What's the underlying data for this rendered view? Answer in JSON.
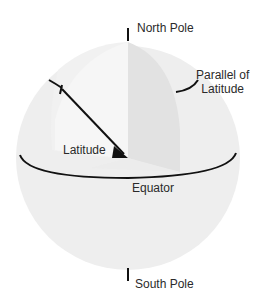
{
  "diagram": {
    "type": "globe-latitude",
    "labels": {
      "north_pole": "North Pole",
      "south_pole": "South Pole",
      "parallel_line1": "Parallel of",
      "parallel_line2": "Latitude",
      "latitude": "Latitude",
      "equator": "Equator"
    },
    "colors": {
      "sphere": "#eeeeee",
      "sphere_inner": "#f3f3f3",
      "wedge": "#e2e2e2",
      "lines": "#111111",
      "text": "#2a2a2a"
    }
  }
}
